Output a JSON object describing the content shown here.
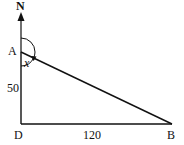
{
  "diagram": {
    "points": {
      "N": {
        "label": "N",
        "x": 21,
        "y": 14
      },
      "A": {
        "label": "A",
        "x": 21,
        "y": 52
      },
      "D": {
        "label": "D",
        "x": 21,
        "y": 124
      },
      "B": {
        "label": "B",
        "x": 172,
        "y": 124
      }
    },
    "edges": [
      {
        "from": "A",
        "to": "D",
        "length_label": "50"
      },
      {
        "from": "D",
        "to": "B",
        "length_label": "120"
      },
      {
        "from": "A",
        "to": "B",
        "length_label": ""
      }
    ],
    "angle_label": "x",
    "north_label": "N",
    "colors": {
      "stroke": "#111111",
      "background": "#ffffff"
    }
  }
}
